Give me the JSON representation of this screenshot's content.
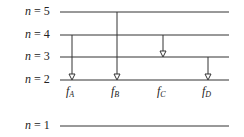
{
  "levels": [
    {
      "n": "5",
      "label_prefix": "n",
      "label_eq": " = ",
      "y": 12
    },
    {
      "n": "4",
      "label_prefix": "n",
      "label_eq": " = ",
      "y": 35
    },
    {
      "n": "3",
      "label_prefix": "n",
      "label_eq": " = ",
      "y": 57
    },
    {
      "n": "2",
      "label_prefix": "n",
      "label_eq": " = ",
      "y": 80
    },
    {
      "n": "1",
      "label_prefix": "n",
      "label_eq": " = ",
      "y": 126
    }
  ],
  "transitions": [
    {
      "name": "A",
      "base": "f",
      "sub": "A",
      "from": 4,
      "to": 2,
      "x": 72
    },
    {
      "name": "B",
      "base": "f",
      "sub": "B",
      "from": 5,
      "to": 2,
      "x": 117
    },
    {
      "name": "C",
      "base": "f",
      "sub": "C",
      "from": 4,
      "to": 3,
      "x": 163
    },
    {
      "name": "D",
      "base": "f",
      "sub": "D",
      "from": 3,
      "to": 2,
      "x": 208
    }
  ],
  "colors": {
    "line": "#333333",
    "text": "#222222"
  }
}
